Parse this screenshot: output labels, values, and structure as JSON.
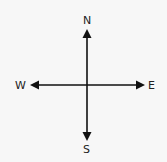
{
  "diagram": {
    "type": "compass-directions",
    "labels": {
      "north": "N",
      "south": "S",
      "east": "E",
      "west": "W"
    },
    "colors": {
      "background": "#f7f7f7",
      "stroke": "#111111"
    }
  }
}
